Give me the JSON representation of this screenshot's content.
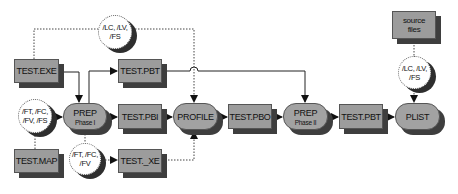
{
  "diagram": {
    "type": "flow",
    "nodes": {
      "test_exe": {
        "label": "TEST.EXE"
      },
      "test_map": {
        "label": "TEST.MAP"
      },
      "test_pbt_top": {
        "label": "TEST.PBT"
      },
      "test_pbi": {
        "label": "TEST.PBI"
      },
      "test_xe": {
        "label": "TEST._XE"
      },
      "test_pbo": {
        "label": "TEST.PBO"
      },
      "test_pbt_right": {
        "label": "TEST.PBT"
      },
      "source_files": {
        "label_line1": "source",
        "label_line2": "files"
      },
      "prep1": {
        "label": "PREP",
        "sub": "Phase I"
      },
      "profile": {
        "label": "PROFILE"
      },
      "prep2": {
        "label": "PREP",
        "sub": "Phase II"
      },
      "plist": {
        "label": "PLIST"
      }
    },
    "options": {
      "top": {
        "line1": "/LC, /LV,",
        "line2": "/FS"
      },
      "left": {
        "line1": "/FT, /FC,",
        "line2": "/FV, /FS"
      },
      "bottom": {
        "line1": "/FT, /FC,",
        "line2": "/FV"
      },
      "right": {
        "line1": "/LC, /LV,",
        "line2": "/FS"
      }
    },
    "edges": [
      {
        "from": "TEST.EXE",
        "to": "PREP Phase I",
        "style": "solid"
      },
      {
        "from": "PREP Phase I",
        "to": "TEST.PBT",
        "style": "solid"
      },
      {
        "from": "PREP Phase I",
        "to": "TEST.PBI",
        "style": "solid"
      },
      {
        "from": "TEST.PBI",
        "to": "PROFILE",
        "style": "solid"
      },
      {
        "from": "PROFILE",
        "to": "TEST.PBO",
        "style": "solid"
      },
      {
        "from": "TEST.PBO",
        "to": "PREP Phase II",
        "style": "solid"
      },
      {
        "from": "TEST.PBT",
        "to": "PREP Phase II",
        "style": "solid"
      },
      {
        "from": "PREP Phase II",
        "to": "TEST.PBT",
        "style": "solid"
      },
      {
        "from": "TEST.PBT",
        "to": "PLIST",
        "style": "solid"
      },
      {
        "from": "TEST.EXE",
        "to": "PROFILE",
        "style": "dotted",
        "via": "/LC, /LV, /FS"
      },
      {
        "from": "/FT, /FC, /FV, /FS",
        "to": "PREP Phase I",
        "style": "solid"
      },
      {
        "from": "TEST.MAP",
        "to": "/FT, /FC, /FV, /FS",
        "style": "dotted"
      },
      {
        "from": "PREP Phase I",
        "to": "TEST._XE",
        "style": "dotted",
        "via": "/FT, /FC, /FV"
      },
      {
        "from": "TEST._XE",
        "to": "PROFILE",
        "style": "dotted"
      },
      {
        "from": "source files",
        "to": "PLIST",
        "style": "dotted",
        "via": "/LC, /LV, /FS"
      }
    ],
    "colors": {
      "box_fill": "#9c9c9c",
      "shadow": "#3e3e3e",
      "circle_fill": "#ffffff",
      "line": "#222222"
    }
  }
}
